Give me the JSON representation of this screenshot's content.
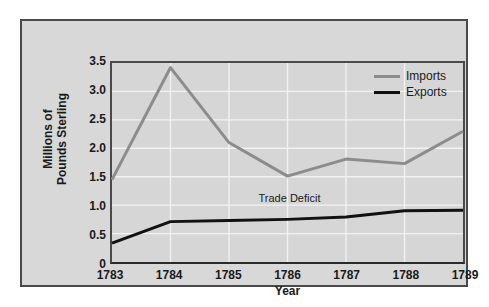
{
  "chart_data": {
    "type": "line",
    "title": "",
    "subtitle": "",
    "xlabel": "Year",
    "ylabel_lines": [
      "Millions of",
      "Pounds Sterling"
    ],
    "ylabel": "Millions of Pounds Sterling",
    "categories": [
      "1783",
      "1784",
      "1785",
      "1786",
      "1787",
      "1788",
      "1789"
    ],
    "x": [
      1783,
      1784,
      1785,
      1786,
      1787,
      1788,
      1789
    ],
    "xlim": [
      1783,
      1789
    ],
    "ylim": [
      0,
      3.5
    ],
    "yticks": [
      "0",
      "0.5",
      "1.0",
      "1.5",
      "2.0",
      "2.5",
      "3.0",
      "3.5"
    ],
    "ytick_values": [
      0,
      0.5,
      1.0,
      1.5,
      2.0,
      2.5,
      3.0,
      3.5
    ],
    "grid": true,
    "grid_color": "#f2f2f2",
    "legend_position": "top-right",
    "series": [
      {
        "name": "Imports",
        "color": "#8c8c8c",
        "values": [
          1.45,
          3.42,
          2.1,
          1.51,
          1.81,
          1.73,
          2.3
        ]
      },
      {
        "name": "Exports",
        "color": "#111111",
        "values": [
          0.33,
          0.71,
          0.73,
          0.75,
          0.79,
          0.9,
          0.91
        ]
      }
    ],
    "annotations": [
      {
        "text": "Trade Deficit",
        "x": 1786,
        "y": 1.17
      }
    ]
  },
  "colors": {
    "panel_background": "#d8d8d8",
    "plot_background": "#d6d6d6",
    "frame": "#4a4a4a",
    "axis": "#2a2a2a",
    "imports": "#8c8c8c",
    "exports": "#111111",
    "gridline": "#f2f2f2",
    "text": "#1a1a1a"
  }
}
